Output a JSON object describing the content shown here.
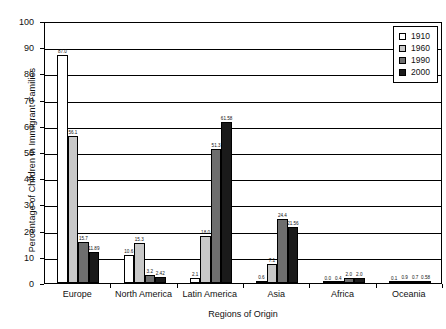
{
  "chart_data": {
    "type": "bar",
    "title": "",
    "xlabel": "Regions of Origin",
    "ylabel": "Percentage of Children in Immigrant Families",
    "ylim": [
      0,
      100
    ],
    "yticks": [
      0,
      10,
      20,
      30,
      40,
      50,
      60,
      70,
      80,
      90,
      100
    ],
    "grid": true,
    "legend_position": "top-right",
    "categories": [
      "Europe",
      "North America",
      "Latin America",
      "Asia",
      "Africa",
      "Oceania"
    ],
    "series": [
      {
        "name": "1910",
        "color": "#ffffff",
        "values": [
          87.0,
          10.6,
          2.1,
          0.6,
          0.0,
          0.1
        ],
        "labels": [
          "87.0",
          "10.6",
          "2.1",
          "0.6",
          "0.0",
          "0.1"
        ]
      },
      {
        "name": "1960",
        "color": "#c8c8c8",
        "values": [
          56.1,
          15.3,
          18.0,
          7.1,
          0.4,
          0.9
        ],
        "labels": [
          "56.1",
          "15.3",
          "18.0",
          "7.1",
          "0.4",
          "0.9"
        ]
      },
      {
        "name": "1990",
        "color": "#6e6e6e",
        "values": [
          15.7,
          3.2,
          51.3,
          24.4,
          2.0,
          0.7
        ],
        "labels": [
          "15.7",
          "3.2",
          "51.3",
          "24.4",
          "2.0",
          "0.7"
        ]
      },
      {
        "name": "2000",
        "color": "#1a1a1a",
        "values": [
          11.89,
          2.42,
          61.58,
          21.56,
          2.0,
          0.58
        ],
        "labels": [
          "11.89",
          "2.42",
          "61.58",
          "21.56",
          "2.0",
          "0.58"
        ]
      }
    ]
  }
}
